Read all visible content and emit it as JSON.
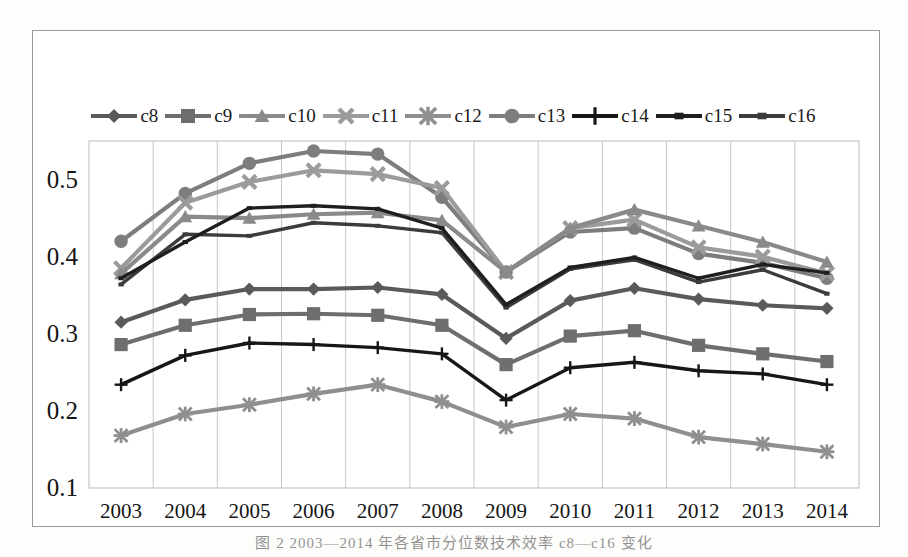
{
  "chart_data": {
    "type": "line",
    "title": "",
    "subtitle": "",
    "xlabel": "",
    "ylabel": "",
    "grid": "vertical",
    "legend_position": "top",
    "ylim": [
      0.1,
      0.55
    ],
    "yticks": [
      "0.1",
      "0.2",
      "0.3",
      "0.4",
      "0.5"
    ],
    "ytick_values": [
      0.1,
      0.2,
      0.3,
      0.4,
      0.5
    ],
    "categories": [
      "2003",
      "2004",
      "2005",
      "2006",
      "2007",
      "2008",
      "2009",
      "2010",
      "2011",
      "2012",
      "2013",
      "2014"
    ],
    "x": [
      2003,
      2004,
      2005,
      2006,
      2007,
      2008,
      2009,
      2010,
      2011,
      2012,
      2013,
      2014
    ],
    "series": [
      {
        "name": "c8",
        "marker": "diamond",
        "color": "#5a5a5a",
        "values": [
          0.315,
          0.344,
          0.358,
          0.358,
          0.36,
          0.351,
          0.294,
          0.343,
          0.359,
          0.345,
          0.337,
          0.333
        ]
      },
      {
        "name": "c9",
        "marker": "square",
        "color": "#6e6e6e",
        "values": [
          0.286,
          0.311,
          0.325,
          0.326,
          0.324,
          0.311,
          0.26,
          0.297,
          0.304,
          0.285,
          0.274,
          0.264
        ]
      },
      {
        "name": "c10",
        "marker": "triangle",
        "color": "#8a8a8a",
        "values": [
          0.378,
          0.452,
          0.45,
          0.455,
          0.457,
          0.447,
          0.38,
          0.437,
          0.461,
          0.44,
          0.419,
          0.393
        ]
      },
      {
        "name": "c11",
        "marker": "x",
        "color": "#9b9b9b",
        "values": [
          0.385,
          0.47,
          0.497,
          0.512,
          0.507,
          0.489,
          0.38,
          0.437,
          0.448,
          0.412,
          0.4,
          0.378
        ]
      },
      {
        "name": "c12",
        "marker": "asterisk",
        "color": "#8f8f8f",
        "values": [
          0.168,
          0.196,
          0.208,
          0.222,
          0.234,
          0.212,
          0.179,
          0.196,
          0.19,
          0.166,
          0.157,
          0.147
        ]
      },
      {
        "name": "c13",
        "marker": "circle",
        "color": "#7d7d7d",
        "values": [
          0.42,
          0.482,
          0.521,
          0.537,
          0.533,
          0.477,
          0.38,
          0.432,
          0.437,
          0.404,
          0.392,
          0.372
        ]
      },
      {
        "name": "c14",
        "marker": "plus",
        "color": "#171717",
        "values": [
          0.234,
          0.272,
          0.288,
          0.286,
          0.282,
          0.274,
          0.214,
          0.256,
          0.263,
          0.252,
          0.248,
          0.234
        ]
      },
      {
        "name": "c15",
        "marker": "line",
        "color": "#1f1f1f",
        "values": [
          0.372,
          0.419,
          0.463,
          0.466,
          0.462,
          0.437,
          0.338,
          0.386,
          0.399,
          0.372,
          0.39,
          0.379
        ]
      },
      {
        "name": "c16",
        "marker": "line",
        "color": "#3c3c3c",
        "values": [
          0.364,
          0.429,
          0.427,
          0.444,
          0.44,
          0.431,
          0.334,
          0.384,
          0.396,
          0.367,
          0.383,
          0.352
        ]
      }
    ]
  },
  "legend": {
    "items": [
      {
        "label": "c8",
        "marker": "diamond",
        "color": "#5a5a5a"
      },
      {
        "label": "c9",
        "marker": "square",
        "color": "#6e6e6e"
      },
      {
        "label": "c10",
        "marker": "triangle",
        "color": "#8a8a8a"
      },
      {
        "label": "c11",
        "marker": "x",
        "color": "#9b9b9b"
      },
      {
        "label": "c12",
        "marker": "asterisk",
        "color": "#8f8f8f"
      },
      {
        "label": "c13",
        "marker": "circle",
        "color": "#7d7d7d"
      },
      {
        "label": "c14",
        "marker": "plus",
        "color": "#171717"
      },
      {
        "label": "c15",
        "marker": "line",
        "color": "#1f1f1f"
      },
      {
        "label": "c16",
        "marker": "line",
        "color": "#3c3c3c"
      }
    ]
  },
  "caption": {
    "text": "图 2 2003—2014 年各省市分位数技术效率 c8—c16 变化"
  }
}
